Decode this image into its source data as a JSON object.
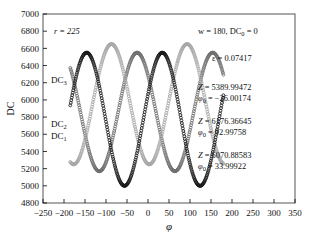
{
  "chart_data": {
    "type": "line",
    "title": "",
    "xlabel": "φ",
    "ylabel": "DC",
    "xlim": [
      -250,
      350
    ],
    "ylim": [
      4800,
      7000
    ],
    "xticks": [
      -250,
      -200,
      -150,
      -100,
      -50,
      0,
      50,
      100,
      150,
      200,
      250,
      300,
      350
    ],
    "yticks": [
      4800,
      5000,
      5200,
      5400,
      5600,
      5800,
      6000,
      6200,
      6400,
      6600,
      6800,
      7000
    ],
    "grid": false,
    "legend_position": "inline-left",
    "marker": "open-circle",
    "x_range_plotted": [
      -185,
      180
    ],
    "series": [
      {
        "name": "DC₁",
        "label_main": "DC",
        "label_sub": "1",
        "color": "#1a1a1a",
        "amplitude": 775,
        "offset": 5775,
        "period": 180,
        "phi0": 33.99922,
        "Z": 6070.88583
      },
      {
        "name": "DC₂",
        "label_main": "DC",
        "label_sub": "2",
        "color": "#a8a8a8",
        "amplitude": 700,
        "offset": 5950,
        "period": 180,
        "phi0": 92.99758,
        "Z": 6176.36645
      },
      {
        "name": "DC₃",
        "label_main": "DC",
        "label_sub": "3",
        "color": "#6f6f6f",
        "amplitude": 690,
        "offset": 5860,
        "period": 180,
        "phi0": -26.00174,
        "Z": 5389.99472
      }
    ],
    "annotations": [
      {
        "id": "radius",
        "text": "r = 225",
        "italic_prefix": "r",
        "x": 0.16,
        "y": 0.115
      },
      {
        "id": "params",
        "text": "w = 180, DC₀ = 0",
        "x": 0.66,
        "y": 0.115
      },
      {
        "id": "epsilon",
        "text": "ε = 0.07417",
        "x": 0.7,
        "y": 0.245
      },
      {
        "id": "fit3",
        "line1": "Z = 5389.99472",
        "line2": "φ₀ = −26.00174",
        "x": 0.66,
        "y": 0.39
      },
      {
        "id": "fit2",
        "line1": "Z = 6176.36645",
        "line2": "φ₀ = 92.99758",
        "x": 0.66,
        "y": 0.535
      },
      {
        "id": "fit1",
        "line1": "Z = 6070.88583",
        "line2": "φ₀ = 33.99922",
        "x": 0.66,
        "y": 0.675
      }
    ]
  },
  "figure": {
    "axis_x_title": "φ",
    "axis_y_title": "DC",
    "tick_labels_x": [
      "−250",
      "−200",
      "−150",
      "−100",
      "−50",
      "0",
      "50",
      "100",
      "150",
      "200",
      "250",
      "300",
      "350"
    ],
    "tick_labels_y": [
      "4800",
      "5000",
      "5200",
      "5400",
      "5600",
      "5800",
      "6000",
      "6200",
      "6400",
      "6600",
      "6800",
      "7000"
    ],
    "series_labels": [
      {
        "main": "DC",
        "sub": "3"
      },
      {
        "main": "DC",
        "sub": "2"
      },
      {
        "main": "DC",
        "sub": "1"
      }
    ],
    "ann_r": "r = 225",
    "ann_w": "w = 180, DC",
    "ann_w_sub": "0",
    "ann_w_tail": " = 0",
    "ann_eps": "ε = 0.07417",
    "ann_z3": "Z = 5389.99472",
    "ann_p3_main": "φ",
    "ann_p3_sub": "0",
    "ann_p3_tail": " = −26.00174",
    "ann_z2": "Z = 6176.36645",
    "ann_p2_tail": " = 92.99758",
    "ann_z1": "Z = 6070.88583",
    "ann_p1_tail": " = 33.99922",
    "frame_color": "#555555",
    "background": "#ffffff"
  }
}
